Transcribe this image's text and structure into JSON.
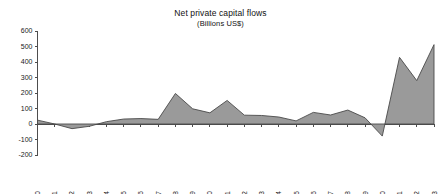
{
  "chart_data": {
    "type": "area",
    "title": "Net private capital flows",
    "subtitle": "(Billions US$)",
    "xlabel": "",
    "ylabel": "",
    "ylim": [
      -200,
      600
    ],
    "ytick_step": 100,
    "yticks": [
      600,
      500,
      400,
      300,
      200,
      100,
      0,
      -100,
      -200
    ],
    "ytick_labels": [
      "600",
      "500",
      "400",
      "300",
      "200",
      "100",
      "0",
      "-100",
      "-200"
    ],
    "categories": [
      "1980",
      "1981",
      "1982",
      "1983",
      "1984",
      "1985",
      "1986",
      "1987",
      "1988",
      "1989",
      "1990",
      "1991",
      "1992",
      "1993",
      "1994",
      "1995",
      "1996",
      "1997",
      "1998",
      "1999",
      "2000",
      "2001",
      "2002",
      "2003"
    ],
    "values": [
      25,
      0,
      -30,
      -15,
      15,
      32,
      35,
      30,
      197,
      98,
      72,
      152,
      57,
      55,
      45,
      20,
      75,
      58,
      90,
      40,
      -78,
      430,
      280,
      512
    ],
    "series": [
      {
        "name": "Net private capital flows",
        "values": [
          25,
          0,
          -30,
          -15,
          15,
          32,
          35,
          30,
          197,
          98,
          72,
          152,
          57,
          55,
          45,
          20,
          75,
          58,
          90,
          40,
          -78,
          430,
          280,
          512
        ]
      }
    ],
    "grid": false,
    "legend": "none",
    "fill_color": "#9a9a9a",
    "line_color": "#4a4a4a",
    "axis_color": "#4d4d4d",
    "background_color": "#ffffff",
    "xtick_rotation": "-90"
  }
}
